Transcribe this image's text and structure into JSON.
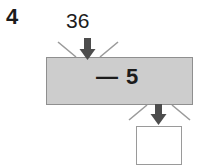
{
  "worksheet": {
    "problem_number": "4",
    "input_value": "36",
    "operation_label": "— 5",
    "answer_value": "",
    "colors": {
      "machine_fill": "#cdcdcd",
      "machine_border": "#8f8f8f",
      "answer_fill": "#ffffff",
      "answer_border": "#9a9a9a",
      "arrow": "#4d4d4d",
      "burst_line": "#9a9a9a",
      "text": "#1c1c1c",
      "page_background": "#ffffff"
    },
    "icons": {
      "input_arrow": "arrow-down-icon",
      "output_arrow": "arrow-down-icon",
      "burst_left_top": "burst-line-icon",
      "burst_right_top": "burst-line-icon",
      "burst_left_bottom": "burst-line-icon",
      "burst_right_bottom": "burst-line-icon"
    }
  }
}
